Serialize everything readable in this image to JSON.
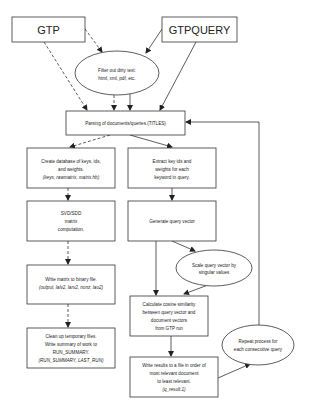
{
  "diagram": {
    "type": "flowchart",
    "nodes": {
      "gtp": {
        "label": "GTP",
        "shape": "rect"
      },
      "gtpquery": {
        "label": "GTPQUERY",
        "shape": "rect"
      },
      "filter": {
        "shape": "ellipse",
        "lines": [
          "Filter out dirty text:",
          "html, xml, pdf, etc."
        ]
      },
      "parsing": {
        "shape": "rect",
        "lines": [
          "Parsing of documents/queries.(TITLES)"
        ]
      },
      "create_db": {
        "shape": "rect",
        "lines": [
          "Create database of keys, ids,",
          "and weights."
        ],
        "italic": "(keys, rawmatrix, matrix.hb)"
      },
      "extract": {
        "shape": "rect",
        "lines": [
          "Extract key ids and",
          "weights for each",
          "keyword in query."
        ]
      },
      "svd": {
        "shape": "rect",
        "lines": [
          "SVD/SDD",
          "matrix",
          "computation."
        ]
      },
      "generate": {
        "shape": "rect",
        "lines": [
          "Generate query vector"
        ]
      },
      "scale": {
        "shape": "ellipse",
        "lines": [
          "Scale query vector by",
          "singular values"
        ]
      },
      "write_matrix": {
        "shape": "rect",
        "lines": [
          "Write matrix to  binary file."
        ],
        "italic": "(output, lalv2, larv2, nonz, lao2)"
      },
      "cosine": {
        "shape": "rect",
        "lines": [
          "Calculate cosine similarity",
          "between query vector and",
          "document vectors",
          "from GTP run"
        ]
      },
      "cleanup": {
        "shape": "rect",
        "lines": [
          "Clean up temporary files.",
          "Write summary of work to",
          "RUN_SUMMARY."
        ],
        "italic": "(RUN_SUMMARY, LAST_RUN)"
      },
      "write_results": {
        "shape": "rect",
        "lines": [
          "Write results to a file in order of",
          "most relevant document",
          "to least relevant."
        ],
        "italic": "(q_result.1)"
      },
      "repeat": {
        "shape": "ellipse",
        "lines": [
          "Repeat process for",
          "each consecutive query"
        ]
      }
    },
    "edges": [
      {
        "from": "gtp",
        "to": "filter",
        "style": "dashed"
      },
      {
        "from": "gtp",
        "to": "parsing",
        "style": "dashed"
      },
      {
        "from": "gtpquery",
        "to": "filter",
        "style": "solid"
      },
      {
        "from": "gtpquery",
        "to": "parsing",
        "style": "solid"
      },
      {
        "from": "filter",
        "to": "parsing",
        "style": "dashed"
      },
      {
        "from": "filter",
        "to": "parsing",
        "style": "solid"
      },
      {
        "from": "parsing",
        "to": "create_db",
        "style": "dashed"
      },
      {
        "from": "parsing",
        "to": "extract",
        "style": "solid"
      },
      {
        "from": "create_db",
        "to": "svd",
        "style": "dashed"
      },
      {
        "from": "svd",
        "to": "write_matrix",
        "style": "dashed"
      },
      {
        "from": "write_matrix",
        "to": "cleanup",
        "style": "dashed"
      },
      {
        "from": "extract",
        "to": "generate",
        "style": "solid"
      },
      {
        "from": "generate",
        "to": "scale",
        "style": "solid"
      },
      {
        "from": "generate",
        "to": "cosine",
        "style": "solid"
      },
      {
        "from": "scale",
        "to": "cosine",
        "style": "solid"
      },
      {
        "from": "cosine",
        "to": "write_results",
        "style": "solid"
      },
      {
        "from": "write_results",
        "to": "repeat",
        "style": "solid"
      },
      {
        "from": "repeat",
        "to": "parsing",
        "style": "solid"
      }
    ]
  }
}
